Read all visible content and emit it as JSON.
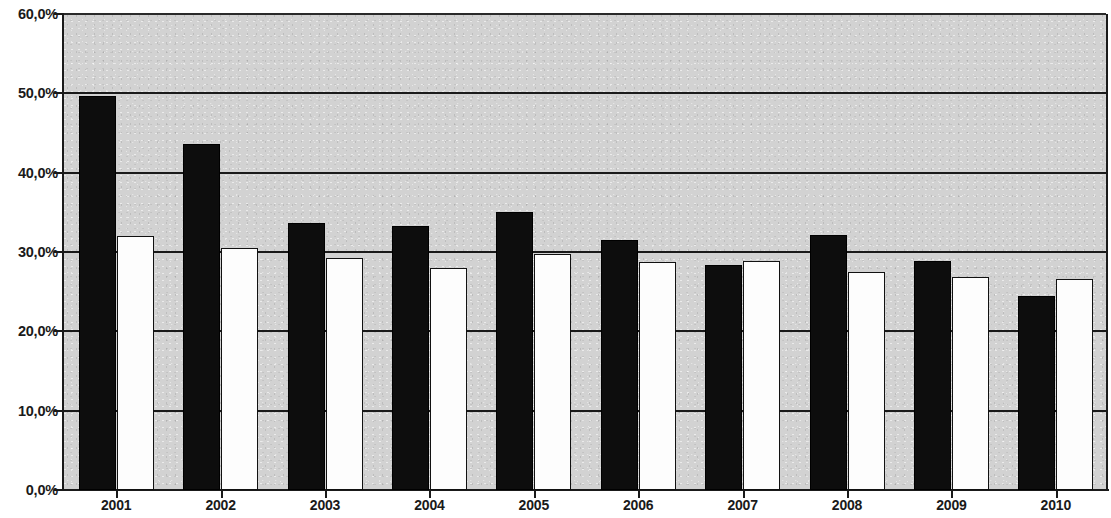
{
  "chart_data": {
    "type": "bar",
    "title": "",
    "subtitle": "",
    "xlabel": "",
    "ylabel": "",
    "categories": [
      "2001",
      "2002",
      "2003",
      "2004",
      "2005",
      "2006",
      "2007",
      "2008",
      "2009",
      "2010"
    ],
    "series": [
      {
        "name": "series-1",
        "color": "#0d0d0d",
        "style": "filled-black",
        "values": [
          49.7,
          43.6,
          33.6,
          33.3,
          35.0,
          31.5,
          28.4,
          32.2,
          28.9,
          24.5
        ]
      },
      {
        "name": "series-2",
        "color": "#fdfdfd",
        "style": "outlined-white",
        "values": [
          32.0,
          30.5,
          29.3,
          28.0,
          29.8,
          28.7,
          28.9,
          27.5,
          26.9,
          26.6
        ]
      }
    ],
    "ylim": [
      0,
      60
    ],
    "ytick_values": [
      0,
      10,
      20,
      30,
      40,
      50,
      60
    ],
    "ytick_labels": [
      "0,0%",
      "10,0%",
      "20,0%",
      "30,0%",
      "40,0%",
      "50,0%",
      "60,0%"
    ],
    "grid": true,
    "grid_axis": "y",
    "legend": null,
    "legend_position": "none",
    "annotations": [],
    "plot_background": "#d2d2d2",
    "axis_color": "#1a1a1a"
  }
}
